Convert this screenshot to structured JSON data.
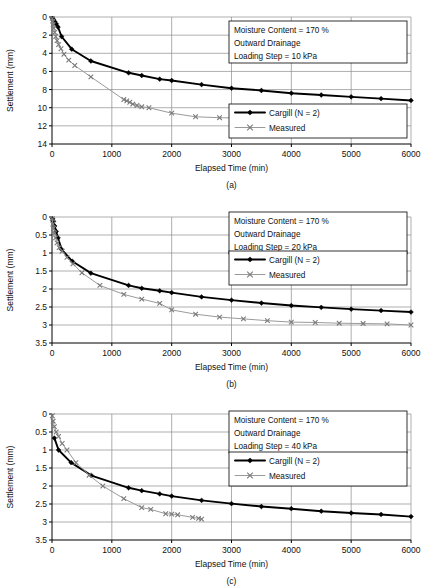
{
  "figure": {
    "panels": [
      {
        "id": "a",
        "label": "(a)",
        "annotation": {
          "lines": [
            "Moisture Content = 170 %",
            "Outward Drainage",
            "Loading Step = 10 kPa"
          ]
        },
        "legend": {
          "entries": [
            {
              "name": "Cargill (N = 2)",
              "marker": "diamond-icon",
              "color": "#000000"
            },
            {
              "name": "Measured",
              "marker": "cross-icon",
              "color": "#9a9a9a"
            }
          ]
        },
        "chart_data": {
          "type": "line",
          "title": "",
          "xlabel": "Elapsed Time (min)",
          "ylabel": "Settlement (mm)",
          "xlim": [
            0,
            6000
          ],
          "ylim": [
            0,
            14
          ],
          "y_inverted": true,
          "xticks": [
            0,
            1000,
            2000,
            3000,
            4000,
            5000,
            6000
          ],
          "yticks": [
            0,
            2,
            4,
            6,
            8,
            10,
            12,
            14
          ],
          "grid": true,
          "legend_position": "lower-right",
          "series": [
            {
              "name": "Cargill (N = 2)",
              "marker": "diamond",
              "color": "#000000",
              "x": [
                10,
                25,
                45,
                70,
                100,
                160,
                330,
                650,
                1280,
                1500,
                1800,
                2000,
                2500,
                3000,
                3500,
                4000,
                4500,
                5000,
                5500,
                6000
              ],
              "y": [
                0.15,
                0.3,
                0.5,
                0.75,
                1.1,
                2.15,
                3.55,
                4.85,
                6.15,
                6.45,
                6.85,
                7.0,
                7.45,
                7.85,
                8.1,
                8.4,
                8.6,
                8.8,
                9.0,
                9.2
              ]
            },
            {
              "name": "Measured",
              "marker": "cross",
              "color": "#9a9a9a",
              "x": [
                5,
                12,
                20,
                30,
                45,
                62,
                85,
                110,
                150,
                200,
                280,
                380,
                650,
                1200,
                1250,
                1300,
                1350,
                1420,
                1500,
                1620,
                2000,
                2400,
                2800,
                3200,
                3600,
                3800
              ],
              "y": [
                0.15,
                0.45,
                0.85,
                1.25,
                1.7,
                2.15,
                2.6,
                3.05,
                3.5,
                4.1,
                4.75,
                5.35,
                6.6,
                9.1,
                9.25,
                9.4,
                9.6,
                9.75,
                9.9,
                10.0,
                10.6,
                11.0,
                11.1,
                11.15,
                11.4,
                11.5
              ]
            }
          ]
        }
      },
      {
        "id": "b",
        "label": "(b)",
        "annotation": {
          "lines": [
            "Moisture Content = 170 %",
            "Outward Drainage",
            "Loading Step = 20 kPa"
          ]
        },
        "legend": {
          "entries": [
            {
              "name": "Cargill (N = 2)",
              "marker": "diamond-icon",
              "color": "#000000"
            },
            {
              "name": "Measured",
              "marker": "cross-icon",
              "color": "#9a9a9a"
            }
          ]
        },
        "chart_data": {
          "type": "line",
          "title": "",
          "xlabel": "Elapsed Time (min)",
          "ylabel": "Settlement (mm)",
          "xlim": [
            0,
            6000
          ],
          "ylim": [
            0,
            3.5
          ],
          "y_inverted": true,
          "xticks": [
            0,
            1000,
            2000,
            3000,
            4000,
            5000,
            6000
          ],
          "yticks": [
            0,
            0.5,
            1,
            1.5,
            2,
            2.5,
            3,
            3.5
          ],
          "grid": true,
          "legend_position": "upper-right",
          "series": [
            {
              "name": "Cargill (N = 2)",
              "marker": "diamond",
              "color": "#000000",
              "x": [
                10,
                25,
                45,
                70,
                100,
                160,
                340,
                650,
                1280,
                1500,
                1800,
                2000,
                2500,
                3000,
                3500,
                4000,
                4500,
                5000,
                5500,
                6000
              ],
              "y": [
                0.05,
                0.12,
                0.25,
                0.4,
                0.58,
                0.9,
                1.23,
                1.56,
                1.9,
                1.98,
                2.05,
                2.1,
                2.22,
                2.31,
                2.39,
                2.46,
                2.51,
                2.56,
                2.6,
                2.64
              ]
            },
            {
              "name": "Measured",
              "marker": "cross",
              "color": "#9a9a9a",
              "x": [
                5,
                15,
                25,
                40,
                60,
                85,
                120,
                170,
                250,
                350,
                500,
                800,
                1200,
                1500,
                1800,
                2000,
                2400,
                2800,
                3200,
                3600,
                4000,
                4400,
                4800,
                5200,
                5600,
                6000
              ],
              "y": [
                0.05,
                0.2,
                0.32,
                0.45,
                0.58,
                0.72,
                0.85,
                0.95,
                1.12,
                1.3,
                1.55,
                1.9,
                2.15,
                2.28,
                2.4,
                2.58,
                2.7,
                2.78,
                2.83,
                2.88,
                2.92,
                2.93,
                2.95,
                2.96,
                2.97,
                3.0
              ]
            }
          ]
        }
      },
      {
        "id": "c",
        "label": "(c)",
        "annotation": {
          "lines": [
            "Moisture Content = 170 %",
            "Outward Drainage",
            "Loading Step = 40 kPa"
          ]
        },
        "legend": {
          "entries": [
            {
              "name": "Cargill (N = 2)",
              "marker": "diamond-icon",
              "color": "#000000"
            },
            {
              "name": "Measured",
              "marker": "cross-icon",
              "color": "#9a9a9a"
            }
          ]
        },
        "chart_data": {
          "type": "line",
          "title": "",
          "xlabel": "Elapsed Time (min)",
          "ylabel": "Settlement (mm)",
          "xlim": [
            0,
            6000
          ],
          "ylim": [
            0,
            3.5
          ],
          "y_inverted": true,
          "xticks": [
            0,
            1000,
            2000,
            3000,
            4000,
            5000,
            6000
          ],
          "yticks": [
            0,
            0.5,
            1,
            1.5,
            2,
            2.5,
            3,
            3.5
          ],
          "grid": true,
          "legend_position": "middle-right",
          "series": [
            {
              "name": "Cargill (N = 2)",
              "marker": "diamond",
              "color": "#000000",
              "x": [
                40,
                110,
                320,
                660,
                1280,
                1500,
                1800,
                2000,
                2500,
                3000,
                3500,
                4000,
                4500,
                5000,
                5500,
                6000
              ],
              "y": [
                0.67,
                1.0,
                1.35,
                1.71,
                2.05,
                2.13,
                2.22,
                2.28,
                2.4,
                2.49,
                2.57,
                2.63,
                2.7,
                2.75,
                2.79,
                2.85
              ]
            },
            {
              "name": "Measured",
              "marker": "cross",
              "color": "#9a9a9a",
              "x": [
                5,
                20,
                40,
                70,
                110,
                170,
                250,
                400,
                620,
                850,
                1200,
                1500,
                1650,
                1900,
                2000,
                2100,
                2350,
                2450,
                2500
              ],
              "y": [
                0.05,
                0.2,
                0.35,
                0.5,
                0.62,
                0.82,
                1.0,
                1.35,
                1.7,
                2.0,
                2.35,
                2.6,
                2.65,
                2.77,
                2.78,
                2.8,
                2.87,
                2.9,
                2.92
              ]
            }
          ]
        }
      }
    ]
  }
}
